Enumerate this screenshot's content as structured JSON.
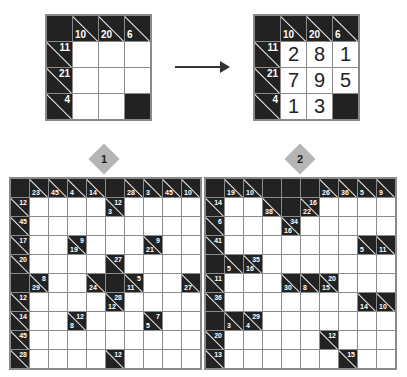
{
  "example": {
    "before": [
      [
        "B",
        "c:10:",
        "c:20:",
        "c:6:"
      ],
      [
        "c::11",
        "W",
        "W",
        "W"
      ],
      [
        "c::21",
        "W",
        "W",
        "W"
      ],
      [
        "c::4",
        "W",
        "W",
        "B"
      ]
    ],
    "after": [
      [
        "B",
        "c:10:",
        "c:20:",
        "c:6:"
      ],
      [
        "c::11",
        "2",
        "8",
        "1"
      ],
      [
        "c::21",
        "7",
        "9",
        "5"
      ],
      [
        "c::4",
        "1",
        "3",
        "B"
      ]
    ],
    "arrow": "right-arrow"
  },
  "puzzles": [
    {
      "label": "1",
      "grid": [
        [
          "B",
          "c:23:",
          "c:45:",
          "c:4:",
          "c:14:",
          "B",
          "c:28:",
          "c:3:",
          "c:45:",
          "c:10:"
        ],
        [
          "c::12",
          "W",
          "W",
          "W",
          "W",
          "c:3:12",
          "W",
          "W",
          "W",
          "W"
        ],
        [
          "c::45",
          "W",
          "W",
          "W",
          "W",
          "W",
          "W",
          "W",
          "W",
          "W"
        ],
        [
          "c::17",
          "W",
          "W",
          "c:19:9",
          "W",
          "W",
          "W",
          "c:21:9",
          "W",
          "W"
        ],
        [
          "c::20",
          "W",
          "W",
          "W",
          "W",
          "c::27",
          "W",
          "W",
          "W",
          "W"
        ],
        [
          "B",
          "c:29:8",
          "W",
          "W",
          "c:24:",
          "B",
          "c:11:5",
          "W",
          "W",
          "c:27:"
        ],
        [
          "c::12",
          "W",
          "W",
          "W",
          "W",
          "c:12:28",
          "W",
          "W",
          "W",
          "W"
        ],
        [
          "c::14",
          "W",
          "W",
          "c:8:12",
          "W",
          "W",
          "W",
          "c:5:7",
          "W",
          "W"
        ],
        [
          "c::45",
          "W",
          "W",
          "W",
          "W",
          "W",
          "W",
          "W",
          "W",
          "W"
        ],
        [
          "c::28",
          "W",
          "W",
          "W",
          "W",
          "c::12",
          "W",
          "W",
          "W",
          "W"
        ]
      ]
    },
    {
      "label": "2",
      "grid": [
        [
          "B",
          "c:19:",
          "c:10:",
          "B",
          "B",
          "B",
          "c:26:",
          "c:36:",
          "c:5:",
          "c:9:"
        ],
        [
          "c::14",
          "W",
          "W",
          "c:38:",
          "B",
          "c:22:16",
          "W",
          "W",
          "W",
          "W"
        ],
        [
          "c::6",
          "W",
          "W",
          "W",
          "c:16:34",
          "W",
          "W",
          "W",
          "W",
          "W"
        ],
        [
          "c::41",
          "W",
          "W",
          "W",
          "W",
          "W",
          "W",
          "W",
          "c:5:",
          "c:11:"
        ],
        [
          "B",
          "c:5:",
          "c:16:35",
          "W",
          "W",
          "W",
          "W",
          "W",
          "W",
          "W"
        ],
        [
          "c::11",
          "W",
          "W",
          "W",
          "c:30:",
          "c:8:",
          "c:15:20",
          "W",
          "W",
          "W"
        ],
        [
          "c::36",
          "W",
          "W",
          "W",
          "W",
          "W",
          "W",
          "W",
          "c:14:",
          "c:10:"
        ],
        [
          "B",
          "c:3:",
          "c:4:29",
          "W",
          "W",
          "W",
          "W",
          "W",
          "W",
          "W"
        ],
        [
          "c::20",
          "W",
          "W",
          "W",
          "W",
          "W",
          "c::12",
          "W",
          "W",
          "W"
        ],
        [
          "c::13",
          "W",
          "W",
          "W",
          "W",
          "W",
          "W",
          "c::15",
          "W",
          "W"
        ]
      ]
    }
  ]
}
